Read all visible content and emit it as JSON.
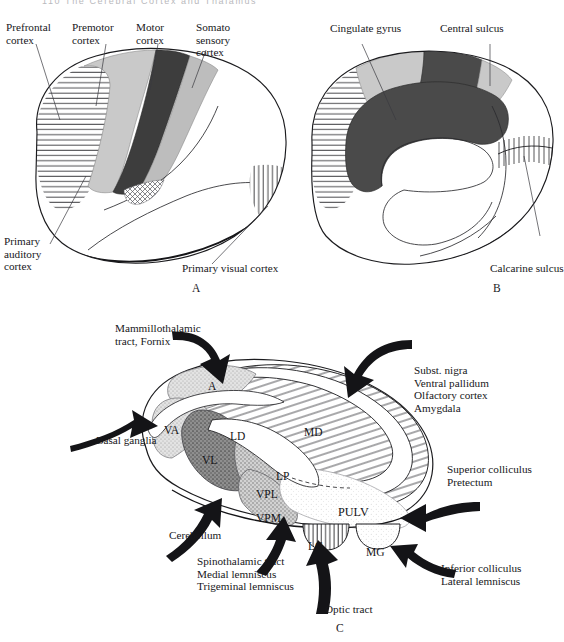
{
  "running_head": "110   The Cerebral Cortex and Thalamus",
  "figure": {
    "panels": [
      {
        "id": "A",
        "letter": "A"
      },
      {
        "id": "B",
        "letter": "B"
      },
      {
        "id": "C",
        "letter": "C"
      }
    ]
  },
  "panel_a": {
    "letter": "A",
    "labels": [
      {
        "name": "prefrontal-cortex",
        "text": "Prefrontal\ncortex"
      },
      {
        "name": "premotor-cortex",
        "text": "Premotor\ncortex"
      },
      {
        "name": "motor-cortex",
        "text": "Motor\ncortex"
      },
      {
        "name": "somatosensory-cortex",
        "text": "Somato\nsensory\ncortex"
      },
      {
        "name": "primary-auditory-cortex",
        "text": "Primary\nauditory\ncortex"
      },
      {
        "name": "primary-visual-cortex",
        "text": "Primary visual cortex"
      }
    ]
  },
  "panel_b": {
    "letter": "B",
    "labels": [
      {
        "name": "cingulate-gyrus",
        "text": "Cingulate gyrus"
      },
      {
        "name": "central-sulcus",
        "text": "Central sulcus"
      },
      {
        "name": "calcarine-sulcus",
        "text": "Calcarine sulcus"
      }
    ]
  },
  "panel_c": {
    "letter": "C",
    "nuclei": [
      {
        "name": "nucleus-a",
        "abbr": "A"
      },
      {
        "name": "nucleus-va",
        "abbr": "VA"
      },
      {
        "name": "nucleus-vl",
        "abbr": "VL"
      },
      {
        "name": "nucleus-ld",
        "abbr": "LD"
      },
      {
        "name": "nucleus-md",
        "abbr": "MD"
      },
      {
        "name": "nucleus-lp",
        "abbr": "LP"
      },
      {
        "name": "nucleus-vpl",
        "abbr": "VPL"
      },
      {
        "name": "nucleus-vpm",
        "abbr": "VPM"
      },
      {
        "name": "nucleus-pulv",
        "abbr": "PULV"
      },
      {
        "name": "nucleus-lg",
        "abbr": "LG"
      },
      {
        "name": "nucleus-mg",
        "abbr": "MG"
      }
    ],
    "inputs": [
      {
        "name": "mammillothalamic-tract-fornix",
        "text": "Mammillothalamic\ntract, Fornix"
      },
      {
        "name": "basal-ganglia",
        "text": "Basal ganglia"
      },
      {
        "name": "cerebellum",
        "text": "Cerebellum"
      },
      {
        "name": "subst-nigra-group",
        "text": "Subst. nigra\nVentral pallidum\nOlfactory cortex\nAmygdala"
      },
      {
        "name": "superior-colliculus-pretectum",
        "text": "Superior colliculus\nPretectum"
      },
      {
        "name": "inferior-colliculus-lateral-lemniscus",
        "text": "Inferior colliculus\nLateral lemniscus"
      },
      {
        "name": "spinothalamic-medial-trigeminal",
        "text": "Spinothalamic tract\nMedial lemniscus\nTrigeminal lemniscus"
      },
      {
        "name": "optic-tract",
        "text": "Optic tract"
      }
    ]
  },
  "colors": {
    "ink": "#1b1b1e",
    "light_gray": "#c9c9c9",
    "mid_gray": "#9a9a9a",
    "dark_gray": "#585858",
    "very_dark": "#3d3d3d",
    "paper": "#ffffff"
  }
}
